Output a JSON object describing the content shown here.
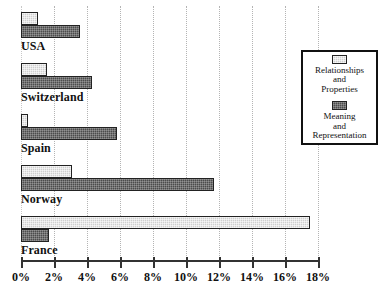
{
  "chart_data": {
    "type": "bar",
    "orientation": "horizontal",
    "title": "",
    "subtitle": "",
    "xlabel": "",
    "ylabel": "",
    "xlim": [
      0,
      18
    ],
    "xtick_labels": [
      "0%",
      "2%",
      "4%",
      "6%",
      "8%",
      "10%",
      "12%",
      "14%",
      "16%",
      "18%"
    ],
    "xticks": [
      0,
      2,
      4,
      6,
      8,
      10,
      12,
      14,
      16,
      18
    ],
    "grid": "vertical-dotted",
    "legend_position": "right",
    "categories": [
      "USA",
      "Switzerland",
      "Spain",
      "Norway",
      "France"
    ],
    "series": [
      {
        "name": "Relationships and Properties",
        "color": "#cfcfcf",
        "values": [
          1.0,
          1.6,
          0.4,
          3.1,
          17.5
        ]
      },
      {
        "name": "Meaning and Representation",
        "color": "#4c4c4c",
        "values": [
          3.6,
          4.3,
          5.8,
          11.7,
          1.7
        ]
      }
    ]
  },
  "legend": {
    "entries": [
      {
        "swatch": "light-swatch",
        "label": "Relationships\nand\nProperties"
      },
      {
        "swatch": "dark-swatch",
        "label": "Meaning\nand\nRepresentation"
      }
    ]
  }
}
